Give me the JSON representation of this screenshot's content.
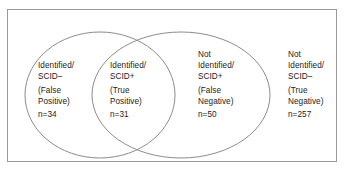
{
  "figure": {
    "type": "venn-diagram",
    "regions": [
      {
        "id": "false-positive",
        "status_line_1": "Identified/",
        "status_line_2": "SCID–",
        "classification": "(False",
        "classification_2": "Positive)",
        "count": "n=34"
      },
      {
        "id": "true-positive",
        "status_line_1": "Identified/",
        "status_line_2": "SCID+",
        "classification": "(True",
        "classification_2": "Positive)",
        "count": "n=31"
      },
      {
        "id": "false-negative",
        "status_line_0": "Not",
        "status_line_1": "Identified/",
        "status_line_2": "SCID+",
        "classification": "(False",
        "classification_2": "Negative)",
        "count": "n=50"
      },
      {
        "id": "true-negative",
        "status_line_0": "Not",
        "status_line_1": "Identified/",
        "status_line_2": "SCID–",
        "classification": "(True",
        "classification_2": "Negative)",
        "count": "n=257"
      }
    ],
    "colors": {
      "frame_stroke": "#9a9a9a",
      "ellipse_stroke": "#8c8c8c",
      "text": "#1c1c1c",
      "background": "#ffffff"
    }
  }
}
